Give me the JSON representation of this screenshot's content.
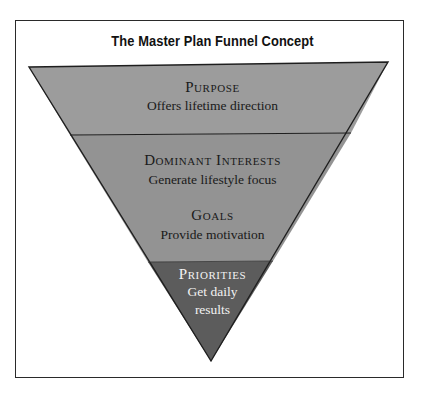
{
  "title": "The Master Plan Funnel Concept",
  "colors": {
    "frame_border": "#2a2a2a",
    "tier_light": "#9c9c9c",
    "tier_mid": "#929292",
    "tier_dark": "#5c5c5c",
    "text_dark": "#1a1a1a",
    "text_light": "#f2f2f2"
  },
  "tiers": [
    {
      "heading": "Purpose",
      "description": "Offers lifetime direction"
    },
    {
      "heading": "Dominant Interests",
      "description": "Generate lifestyle focus"
    },
    {
      "heading": "Goals",
      "description": "Provide motivation"
    },
    {
      "heading": "Priorities",
      "description_line1": "Get daily",
      "description_line2": "results"
    }
  ]
}
